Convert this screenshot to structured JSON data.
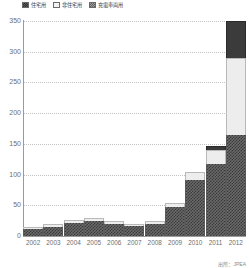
{
  "chart_data": {
    "type": "bar",
    "stacked": true,
    "title": "",
    "xlabel": "",
    "ylabel": "",
    "ylim": [
      0,
      350
    ],
    "ytick_step": 50,
    "yticks": [
      350,
      300,
      250,
      200,
      150,
      100,
      50,
      0
    ],
    "grid": true,
    "legend_position": "top-left",
    "categories": [
      "2002",
      "2003",
      "2004",
      "2005",
      "2006",
      "2007",
      "2008",
      "2009",
      "2010",
      "2011",
      "2012"
    ],
    "series": [
      {
        "name": "住宅用",
        "color": "#4a4a4a",
        "values": [
          11,
          15,
          21,
          25,
          20,
          16,
          20,
          48,
          92,
          118,
          176
        ]
      },
      {
        "name": "非住宅用",
        "color": "#ededed",
        "values": [
          3,
          4,
          5,
          5,
          4,
          4,
          4,
          6,
          13,
          22,
          135
        ]
      },
      {
        "name": "充電車両用",
        "color": "#3b3b3b",
        "values": [
          0,
          0,
          0,
          0,
          0,
          0,
          0,
          0,
          0,
          6,
          65
        ]
      }
    ],
    "totals": [
      14,
      19,
      26,
      30,
      24,
      20,
      24,
      54,
      105,
      146,
      376
    ]
  },
  "legend": {
    "items": [
      {
        "label": "住宅用",
        "swatch": "residential-swatch"
      },
      {
        "label": "非住宅用",
        "swatch": "non-residential-swatch"
      },
      {
        "label": "充電車両用",
        "swatch": "ev-charging-swatch"
      }
    ]
  },
  "source_note": "出所：JPEA"
}
